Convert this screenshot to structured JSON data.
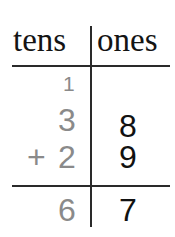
{
  "header": {
    "tens_label": "tens",
    "ones_label": "ones"
  },
  "carry": {
    "tens": "1"
  },
  "addend1": {
    "tens": "3",
    "ones": "8"
  },
  "addend2": {
    "operator": "+",
    "tens": "2",
    "ones": "9"
  },
  "sum": {
    "tens": "6",
    "ones": "7"
  },
  "colors": {
    "tens_digits": "#8a8a8a",
    "ones_digits": "#111111",
    "lines": "#2a2a2a"
  }
}
